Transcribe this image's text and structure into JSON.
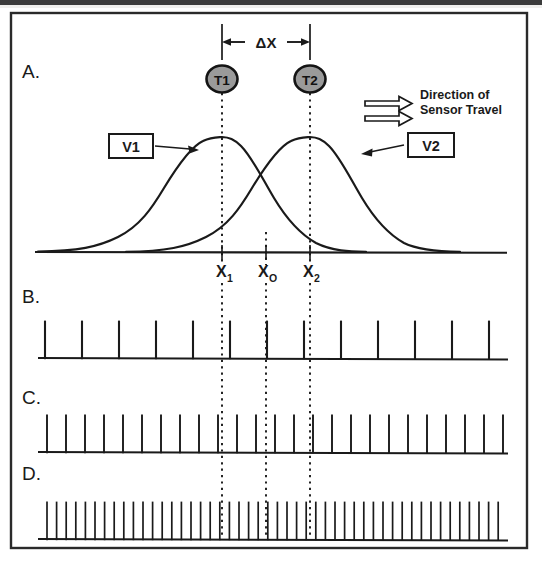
{
  "figure": {
    "panels": [
      {
        "id": "A",
        "label": "A."
      },
      {
        "id": "B",
        "label": "B."
      },
      {
        "id": "C",
        "label": "C."
      },
      {
        "id": "D",
        "label": "D."
      }
    ],
    "annotations": {
      "delta_x": "ΔX",
      "sensor_t1": "T1",
      "sensor_t2": "T2",
      "curve_v1": "V1",
      "curve_v2": "V2",
      "direction_line1": "Direction of",
      "direction_line2": "Sensor Travel",
      "x1": "X",
      "x1_sub": "1",
      "x0": "X",
      "x0_sub": "O",
      "x2": "X",
      "x2_sub": "2"
    },
    "colors": {
      "ink": "#1a1a1a",
      "sensor_fill": "#9a9a9a",
      "background": "#ffffff",
      "frame": "#2a2a2a"
    }
  },
  "chart_data": {
    "type": "line",
    "xlabel": "",
    "ylabel": "",
    "grid": false,
    "legend_position": "inline-callouts",
    "panels": [
      {
        "id": "A",
        "type": "line",
        "description": "Two overlapping Gaussian sensor response curves V1 and V2 separated by delta X",
        "xlim": [
          0,
          100
        ],
        "ylim": [
          0,
          1
        ],
        "markers": [
          {
            "name": "X1",
            "x": 41.0,
            "label": "X1",
            "sensor": "T1"
          },
          {
            "name": "X0",
            "x": 51.0,
            "label": "X0",
            "sensor": null
          },
          {
            "name": "X2",
            "x": 61.0,
            "label": "X2",
            "sensor": "T2"
          }
        ],
        "delta_x": {
          "from": 41.0,
          "to": 61.0,
          "value": 20.0,
          "label": "ΔX"
        },
        "series": [
          {
            "name": "V1",
            "mean": 41.0,
            "sigma": 11.5,
            "peak": 1.0
          },
          {
            "name": "V2",
            "mean": 61.0,
            "sigma": 11.5,
            "peak": 1.0
          }
        ]
      },
      {
        "id": "B",
        "type": "bar",
        "description": "Low frequency pulse train",
        "pulse_count": 13,
        "pulse_spacing_px": 37,
        "pulse_height_px": 38,
        "first_pulse_px": 45
      },
      {
        "id": "C",
        "type": "bar",
        "description": "Medium frequency pulse train, roughly double the rate of panel B",
        "pulse_count": 25,
        "pulse_spacing_px": 19,
        "pulse_height_px": 38,
        "first_pulse_px": 47
      },
      {
        "id": "D",
        "type": "bar",
        "description": "High frequency pulse train, roughly double the rate of panel C",
        "pulse_count": 49,
        "pulse_spacing_px": 9.6,
        "pulse_height_px": 38,
        "first_pulse_px": 47
      }
    ]
  }
}
